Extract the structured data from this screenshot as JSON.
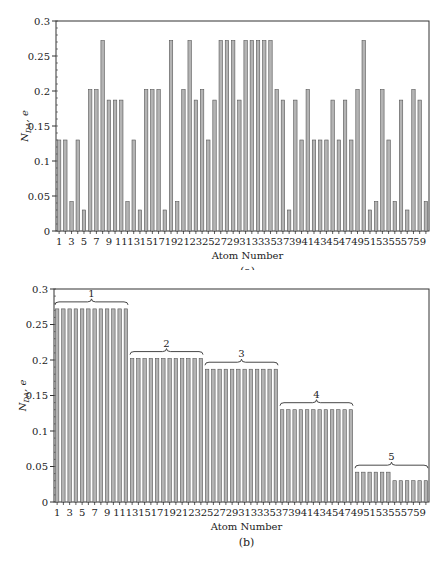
{
  "chart_data": [
    {
      "type": "bar",
      "panel": "(a)",
      "title": "",
      "xlabel": "Atom Number",
      "ylabel": "N_DA, e",
      "ylim": [
        0,
        0.3
      ],
      "yticks": [
        0,
        0.05,
        0.1,
        0.15,
        0.2,
        0.25,
        0.3
      ],
      "xtick_labels": [
        "1",
        "3",
        "5",
        "7",
        "9",
        "11",
        "13",
        "15",
        "17",
        "19",
        "21",
        "23",
        "25",
        "27",
        "29",
        "31",
        "33",
        "35",
        "37",
        "39",
        "41",
        "43",
        "45",
        "47",
        "49",
        "51",
        "53",
        "55",
        "57",
        "59"
      ],
      "grid": false,
      "categories": [
        1,
        2,
        3,
        4,
        5,
        6,
        7,
        8,
        9,
        10,
        11,
        12,
        13,
        14,
        15,
        16,
        17,
        18,
        19,
        20,
        21,
        22,
        23,
        24,
        25,
        26,
        27,
        28,
        29,
        30,
        31,
        32,
        33,
        34,
        35,
        36,
        37,
        38,
        39,
        40,
        41,
        42,
        43,
        44,
        45,
        46,
        47,
        48,
        49,
        50,
        51,
        52,
        53,
        54,
        55,
        56,
        57,
        58,
        59,
        60
      ],
      "values": [
        0.13,
        0.13,
        0.042,
        0.13,
        0.03,
        0.202,
        0.202,
        0.272,
        0.187,
        0.187,
        0.187,
        0.042,
        0.13,
        0.03,
        0.202,
        0.202,
        0.202,
        0.03,
        0.272,
        0.042,
        0.202,
        0.272,
        0.187,
        0.202,
        0.13,
        0.187,
        0.272,
        0.272,
        0.272,
        0.187,
        0.272,
        0.272,
        0.272,
        0.272,
        0.272,
        0.202,
        0.187,
        0.03,
        0.187,
        0.13,
        0.202,
        0.13,
        0.13,
        0.13,
        0.187,
        0.13,
        0.187,
        0.13,
        0.202,
        0.272,
        0.03,
        0.042,
        0.202,
        0.13,
        0.042,
        0.187,
        0.03,
        0.202,
        0.187,
        0.042
      ]
    },
    {
      "type": "bar",
      "panel": "(b)",
      "title": "",
      "xlabel": "Atom Number",
      "ylabel": "N_DA, e",
      "ylim": [
        0,
        0.3
      ],
      "yticks": [
        0,
        0.05,
        0.1,
        0.15,
        0.2,
        0.25,
        0.3
      ],
      "xtick_labels": [
        "1",
        "3",
        "5",
        "7",
        "9",
        "11",
        "13",
        "15",
        "17",
        "19",
        "21",
        "23",
        "25",
        "27",
        "29",
        "31",
        "33",
        "35",
        "37",
        "39",
        "41",
        "43",
        "45",
        "47",
        "49",
        "51",
        "53",
        "55",
        "57",
        "59"
      ],
      "grid": false,
      "categories": [
        1,
        2,
        3,
        4,
        5,
        6,
        7,
        8,
        9,
        10,
        11,
        12,
        13,
        14,
        15,
        16,
        17,
        18,
        19,
        20,
        21,
        22,
        23,
        24,
        25,
        26,
        27,
        28,
        29,
        30,
        31,
        32,
        33,
        34,
        35,
        36,
        37,
        38,
        39,
        40,
        41,
        42,
        43,
        44,
        45,
        46,
        47,
        48,
        49,
        50,
        51,
        52,
        53,
        54,
        55,
        56,
        57,
        58,
        59,
        60
      ],
      "values": [
        0.272,
        0.272,
        0.272,
        0.272,
        0.272,
        0.272,
        0.272,
        0.272,
        0.272,
        0.272,
        0.272,
        0.272,
        0.202,
        0.202,
        0.202,
        0.202,
        0.202,
        0.202,
        0.202,
        0.202,
        0.202,
        0.202,
        0.202,
        0.202,
        0.187,
        0.187,
        0.187,
        0.187,
        0.187,
        0.187,
        0.187,
        0.187,
        0.187,
        0.187,
        0.187,
        0.187,
        0.13,
        0.13,
        0.13,
        0.13,
        0.13,
        0.13,
        0.13,
        0.13,
        0.13,
        0.13,
        0.13,
        0.13,
        0.042,
        0.042,
        0.042,
        0.042,
        0.042,
        0.042,
        0.03,
        0.03,
        0.03,
        0.03,
        0.03,
        0.03
      ],
      "annotations": [
        {
          "label": "1",
          "from": 1,
          "to": 12
        },
        {
          "label": "2",
          "from": 13,
          "to": 24
        },
        {
          "label": "3",
          "from": 25,
          "to": 36
        },
        {
          "label": "4",
          "from": 37,
          "to": 48
        },
        {
          "label": "5",
          "from": 49,
          "to": 60
        }
      ]
    }
  ],
  "panels": {
    "a": {
      "caption": "(a)",
      "xlabel": "Atom Number",
      "ylabel_main": "N",
      "ylabel_sub": "DA",
      "ylabel_tail": ", e"
    },
    "b": {
      "caption": "(b)",
      "xlabel": "Atom Number",
      "ylabel_main": "N",
      "ylabel_sub": "DA",
      "ylabel_tail": ", e"
    }
  },
  "style": {
    "bar_fill": "#b4b4b4",
    "bar_stroke": "#555555",
    "axis_color": "#333333"
  }
}
